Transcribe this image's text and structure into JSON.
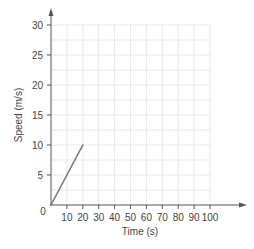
{
  "chart_data": {
    "type": "line",
    "title": "",
    "xlabel": "Time (s)",
    "ylabel": "Speed (m/s)",
    "xlim": [
      0,
      100
    ],
    "ylim": [
      0,
      30
    ],
    "x_ticks": [
      10,
      20,
      30,
      40,
      50,
      60,
      70,
      80,
      90,
      100
    ],
    "y_ticks": [
      5,
      10,
      15,
      20,
      25,
      30
    ],
    "origin_label": "0",
    "grid": true,
    "legend": null,
    "series": [
      {
        "name": "speed",
        "x": [
          0,
          20
        ],
        "y": [
          0,
          10
        ],
        "color": "#777777"
      }
    ]
  },
  "colors": {
    "axis": "#555555",
    "grid": "#e8e8e8",
    "line": "#777777",
    "text": "#444444"
  }
}
